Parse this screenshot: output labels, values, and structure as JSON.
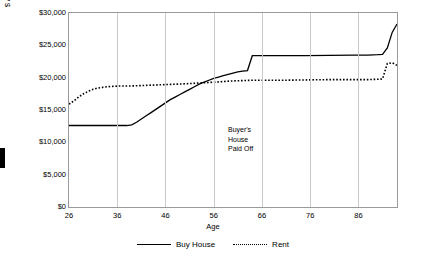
{
  "chart_data": {
    "type": "line",
    "title": "",
    "xlabel": "Age",
    "ylabel": "$ Available for Annual Consumption",
    "xlim": [
      26,
      94
    ],
    "ylim": [
      0,
      30000
    ],
    "xticks": [
      26,
      36,
      46,
      56,
      66,
      76,
      86
    ],
    "yticks": [
      0,
      5000,
      10000,
      15000,
      20000,
      25000,
      30000
    ],
    "ytick_labels": [
      "$0",
      "$5,000",
      "$10,000",
      "$15,000",
      "$20,000",
      "$25,000",
      "$30,000"
    ],
    "grid": "vertical",
    "legend_position": "bottom",
    "annotations": [
      {
        "text_lines": [
          "Buyer's",
          "House",
          "Paid Off"
        ],
        "x": 60,
        "y": 17500
      }
    ],
    "series": [
      {
        "name": "Buy House",
        "style": "solid",
        "color": "#000000",
        "x": [
          26,
          27,
          28,
          29,
          30,
          31,
          32,
          33,
          34,
          35,
          36,
          37,
          38,
          39,
          40,
          41,
          42,
          43,
          44,
          45,
          46,
          47,
          48,
          49,
          50,
          51,
          52,
          53,
          54,
          55,
          56,
          57,
          58,
          59,
          60,
          61,
          62,
          63,
          64,
          65,
          66,
          67,
          70,
          75,
          80,
          85,
          88,
          90,
          91,
          92,
          93,
          94
        ],
        "y": [
          12600,
          12600,
          12600,
          12600,
          12600,
          12600,
          12600,
          12600,
          12600,
          12600,
          12600,
          12600,
          12600,
          12700,
          13100,
          13600,
          14100,
          14600,
          15100,
          15600,
          16100,
          16600,
          17000,
          17400,
          17800,
          18200,
          18600,
          19000,
          19300,
          19600,
          19900,
          20100,
          20300,
          20500,
          20700,
          20900,
          21000,
          21100,
          23400,
          23400,
          23400,
          23400,
          23400,
          23400,
          23450,
          23500,
          23500,
          23550,
          23600,
          24600,
          27000,
          28300
        ]
      },
      {
        "name": "Rent",
        "style": "dotted",
        "color": "#000000",
        "x": [
          26,
          27,
          28,
          29,
          30,
          31,
          32,
          33,
          34,
          35,
          36,
          37,
          38,
          40,
          45,
          50,
          55,
          58,
          60,
          62,
          64,
          66,
          70,
          75,
          80,
          85,
          88,
          90,
          91,
          92,
          93,
          94
        ],
        "y": [
          15900,
          16400,
          17000,
          17500,
          17900,
          18200,
          18400,
          18500,
          18600,
          18650,
          18700,
          18700,
          18700,
          18750,
          18900,
          19050,
          19250,
          19400,
          19500,
          19550,
          19600,
          19600,
          19600,
          19650,
          19700,
          19700,
          19700,
          19750,
          19800,
          22200,
          22300,
          21900
        ]
      }
    ]
  },
  "left_marker": {
    "label": "page-edge-marker"
  }
}
